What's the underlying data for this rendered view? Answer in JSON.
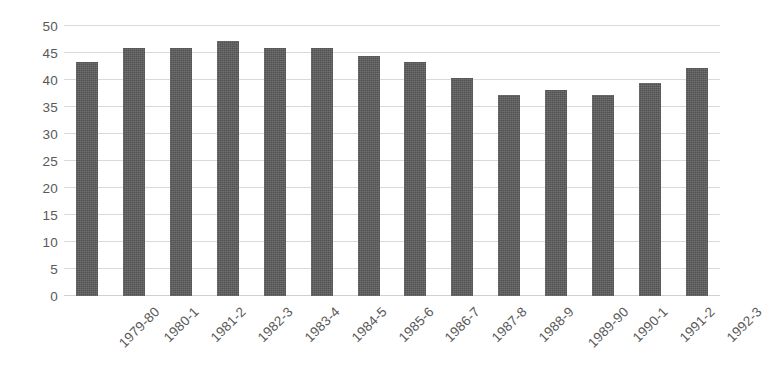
{
  "chart_data": {
    "type": "bar",
    "title": "",
    "subtitle": "",
    "xlabel": "",
    "ylabel": "",
    "categories": [
      "1979-80",
      "1980-1",
      "1981-2",
      "1982-3",
      "1983-4",
      "1984-5",
      "1985-6",
      "1986-7",
      "1987-8",
      "1988-9",
      "1989-90",
      "1990-1",
      "1991-2",
      "1992-3"
    ],
    "values": [
      43.3,
      46.0,
      46.0,
      47.2,
      46.0,
      46.0,
      44.4,
      43.3,
      40.4,
      37.3,
      38.2,
      37.3,
      39.4,
      42.3
    ],
    "ylim": [
      0,
      50
    ],
    "y_ticks": [
      0,
      5,
      10,
      15,
      20,
      25,
      30,
      35,
      40,
      45,
      50
    ],
    "y_tick_labels": [
      "0",
      "5",
      "10",
      "15",
      "20",
      "25",
      "30",
      "35",
      "40",
      "45",
      "50"
    ],
    "grid": true,
    "grid_axis": "y",
    "legend": false,
    "legend_position": "none",
    "bar_color": "#5a5a5a",
    "grid_color": "#d9d9d9",
    "tick_label_color": "#595959",
    "background_color": "#ffffff",
    "x_tick_rotation": -45
  }
}
